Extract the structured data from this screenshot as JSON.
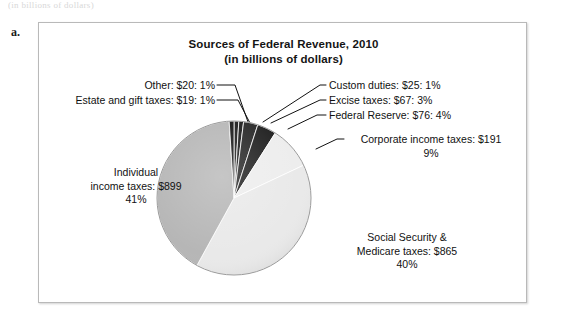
{
  "figure": {
    "letter": "a.",
    "top_clipped_text": "(in billions of dollars)"
  },
  "chart_data": {
    "type": "pie",
    "title": "Sources of Federal Revenue, 2010",
    "subtitle": "(in billions of dollars)",
    "units": "billions of dollars",
    "year": 2010,
    "total": 2162,
    "legend_position": "callout-labels",
    "categories": [
      "Other",
      "Custom duties",
      "Excise taxes",
      "Federal Reserve",
      "Corporate income taxes",
      "Social Security & Medicare taxes",
      "Individual income taxes",
      "Estate and gift taxes"
    ],
    "values": [
      20,
      25,
      67,
      76,
      191,
      865,
      899,
      19
    ],
    "percents": [
      1,
      1,
      3,
      4,
      9,
      40,
      41,
      1
    ],
    "colors": [
      "#1a1a1a",
      "#1a1a1a",
      "#262626",
      "#1f1f1f",
      "#ededed",
      "#e9e9e9",
      "#b6b6b6",
      "#151515"
    ],
    "slices": [
      {
        "name": "Other",
        "value": 20,
        "percent": 1,
        "color": "#1a1a1a"
      },
      {
        "name": "Custom duties",
        "value": 25,
        "percent": 1,
        "color": "#1a1a1a"
      },
      {
        "name": "Excise taxes",
        "value": 67,
        "percent": 3,
        "color": "#262626"
      },
      {
        "name": "Federal Reserve",
        "value": 76,
        "percent": 4,
        "color": "#1f1f1f"
      },
      {
        "name": "Corporate income taxes",
        "value": 191,
        "percent": 9,
        "color": "#ededed"
      },
      {
        "name": "Social Security & Medicare taxes",
        "value": 865,
        "percent": 40,
        "color": "#e9e9e9"
      },
      {
        "name": "Individual income taxes",
        "value": 899,
        "percent": 41,
        "color": "#b6b6b6"
      },
      {
        "name": "Estate and gift taxes",
        "value": 19,
        "percent": 1,
        "color": "#151515"
      }
    ]
  },
  "labels": {
    "other": "Other: $20: 1%",
    "estate": "Estate and gift taxes: $19: 1%",
    "custom": "Custom duties: $25: 1%",
    "excise": "Excise taxes: $67: 3%",
    "federal_reserve": "Federal Reserve: $76: 4%",
    "corporate_line1": "Corporate income taxes: $191",
    "corporate_line2": "9%",
    "individual_line1": "Individual",
    "individual_line2": "income taxes: $899",
    "individual_line3": "41%",
    "social_line1": "Social Security &",
    "social_line2": "Medicare taxes: $865",
    "social_line3": "40%"
  }
}
